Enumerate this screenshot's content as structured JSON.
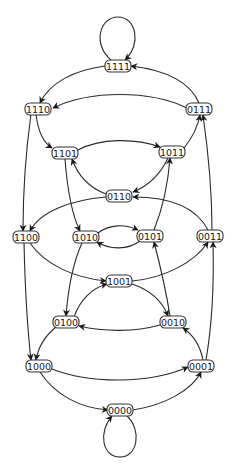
{
  "diagram": {
    "type": "state-transition-graph",
    "colors": {
      "stroke": "#2a2a2a",
      "node_fill": "#ffffff",
      "text": "#1a1a1a"
    },
    "nodes": [
      {
        "id": "1111",
        "label": "1111",
        "x": 118,
        "y": 66
      },
      {
        "id": "1110",
        "label": "1110",
        "x": 38,
        "y": 109
      },
      {
        "id": "0111",
        "label": "0111",
        "x": 199,
        "y": 109
      },
      {
        "id": "1101",
        "label": "1101",
        "x": 65,
        "y": 153
      },
      {
        "id": "1011",
        "label": "1011",
        "x": 172,
        "y": 152
      },
      {
        "id": "0110",
        "label": "0110",
        "x": 119,
        "y": 196
      },
      {
        "id": "1100",
        "label": "1100",
        "x": 26,
        "y": 237
      },
      {
        "id": "1010",
        "label": "1010",
        "x": 86,
        "y": 237
      },
      {
        "id": "0101",
        "label": "0101",
        "x": 150,
        "y": 236
      },
      {
        "id": "0011",
        "label": "0011",
        "x": 210,
        "y": 236
      },
      {
        "id": "1001",
        "label": "1001",
        "x": 119,
        "y": 281
      },
      {
        "id": "0100",
        "label": "0100",
        "x": 66,
        "y": 322
      },
      {
        "id": "0010",
        "label": "0010",
        "x": 173,
        "y": 322
      },
      {
        "id": "1000",
        "label": "1000",
        "x": 39,
        "y": 366
      },
      {
        "id": "0001",
        "label": "0001",
        "x": 201,
        "y": 366
      },
      {
        "id": "0000",
        "label": "0000",
        "x": 120,
        "y": 410
      }
    ],
    "edges": [
      {
        "from": "1111",
        "to": "1111",
        "kind": "self-loop"
      },
      {
        "from": "1111",
        "to": "1110"
      },
      {
        "from": "0111",
        "to": "1111"
      },
      {
        "from": "0111",
        "to": "1110"
      },
      {
        "from": "1110",
        "to": "1101"
      },
      {
        "from": "1110",
        "to": "1100"
      },
      {
        "from": "1101",
        "to": "1011"
      },
      {
        "from": "1011",
        "to": "0111"
      },
      {
        "from": "1101",
        "to": "1010"
      },
      {
        "from": "1011",
        "to": "0110"
      },
      {
        "from": "0110",
        "to": "1101"
      },
      {
        "from": "0101",
        "to": "1011"
      },
      {
        "from": "0110",
        "to": "1100"
      },
      {
        "from": "0011",
        "to": "0110"
      },
      {
        "from": "0011",
        "to": "0111"
      },
      {
        "from": "1010",
        "to": "0101"
      },
      {
        "from": "0101",
        "to": "1010"
      },
      {
        "from": "1100",
        "to": "1001"
      },
      {
        "from": "1001",
        "to": "0011"
      },
      {
        "from": "1010",
        "to": "0100"
      },
      {
        "from": "0010",
        "to": "0101"
      },
      {
        "from": "0100",
        "to": "1001"
      },
      {
        "from": "1001",
        "to": "0010"
      },
      {
        "from": "0010",
        "to": "0100"
      },
      {
        "from": "1100",
        "to": "1000"
      },
      {
        "from": "0100",
        "to": "1000"
      },
      {
        "from": "0001",
        "to": "0010"
      },
      {
        "from": "0001",
        "to": "0011"
      },
      {
        "from": "1000",
        "to": "0001"
      },
      {
        "from": "1000",
        "to": "0000"
      },
      {
        "from": "0000",
        "to": "0001"
      },
      {
        "from": "0000",
        "to": "0000",
        "kind": "self-loop"
      }
    ]
  }
}
